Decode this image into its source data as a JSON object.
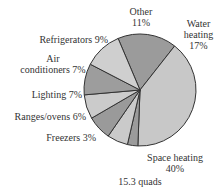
{
  "chart_data": {
    "type": "pie",
    "title": "",
    "total_label": "15.3 quads",
    "start_angle_deg": -23,
    "direction": "clockwise",
    "slices": [
      {
        "label": "Water heating",
        "value": 17,
        "color": "#9b9b9b"
      },
      {
        "label": "Space heating",
        "value": 40,
        "color": "#c8c8c8"
      },
      {
        "label": "Freezers",
        "value": 3,
        "color": "#9b9b9b"
      },
      {
        "label": "Ranges/ovens",
        "value": 6,
        "color": "#cacaca"
      },
      {
        "label": "Lighting",
        "value": 7,
        "color": "#9a9a9a"
      },
      {
        "label": "Air conditioners",
        "value": 7,
        "color": "#cbcbcb"
      },
      {
        "label": "Refrigerators",
        "value": 9,
        "color": "#9d9d9d"
      },
      {
        "label": "Other",
        "value": 11,
        "color": "#cfcfcf"
      }
    ]
  },
  "labels": {
    "other": {
      "line1": "Other",
      "line2": "11%"
    },
    "water": {
      "line1": "Water",
      "line2": "heating",
      "line3": "17%"
    },
    "refrigerators": {
      "line1": "Refrigerators 9%"
    },
    "air": {
      "line1": "Air",
      "line2": "conditioners 7%"
    },
    "lighting": {
      "line1": "Lighting 7%"
    },
    "ranges": {
      "line1": "Ranges/ovens 6%"
    },
    "freezers": {
      "line1": "Freezers 3%"
    },
    "space": {
      "line1": "Space heating",
      "line2": "40%"
    },
    "total": "15.3 quads"
  }
}
